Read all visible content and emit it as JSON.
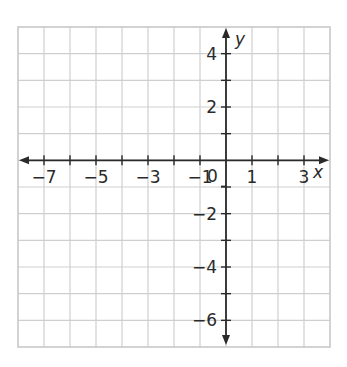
{
  "chart_data": {
    "type": "coordinate-grid",
    "title": "",
    "xlabel": "x",
    "ylabel": "y",
    "xlim": [
      -8,
      4
    ],
    "ylim": [
      -7,
      5
    ],
    "grid": true,
    "grid_step": 1,
    "x_tick_labels": [
      "−7",
      "−5",
      "−3",
      "−1",
      "1",
      "3"
    ],
    "x_tick_values": [
      -7,
      -5,
      -3,
      -1,
      1,
      3
    ],
    "y_tick_labels": [
      "4",
      "2",
      "−2",
      "−4",
      "−6"
    ],
    "y_tick_values": [
      4,
      2,
      -2,
      -4,
      -6
    ],
    "origin_label": "0",
    "series": []
  },
  "axes": {
    "x_name": "x",
    "y_name": "y",
    "origin": "0",
    "x_labels": [
      {
        "text": "−7",
        "value": -7
      },
      {
        "text": "−5",
        "value": -5
      },
      {
        "text": "−3",
        "value": -3
      },
      {
        "text": "−1",
        "value": -1
      },
      {
        "text": "1",
        "value": 1
      },
      {
        "text": "3",
        "value": 3
      }
    ],
    "y_labels": [
      {
        "text": "4",
        "value": 4
      },
      {
        "text": "2",
        "value": 2
      },
      {
        "text": "−2",
        "value": -2
      },
      {
        "text": "−4",
        "value": -4
      },
      {
        "text": "−6",
        "value": -6
      }
    ]
  },
  "colors": {
    "grid": "#cfcfcf",
    "axis": "#2a2a2a",
    "background": "#ffffff"
  }
}
